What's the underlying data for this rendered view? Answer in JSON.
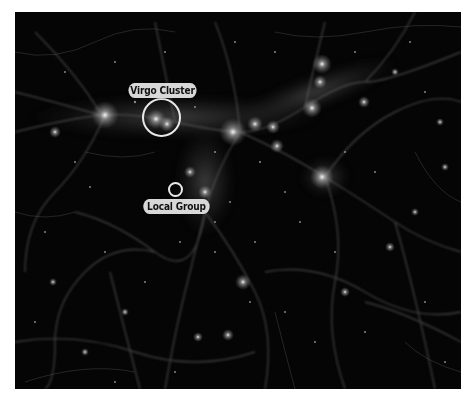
{
  "image": {
    "description": "Cosmic web simulation showing filaments and galaxy clusters in grayscale",
    "background_color": "#050505",
    "filament_color": "#9a9a9a",
    "node_color": "#ffffff"
  },
  "annotations": [
    {
      "label": "Virgo Cluster",
      "marker": "circle",
      "marker_color": "#e8e8e8",
      "label_bg": "#d8d8d8",
      "label_text_color": "#111111"
    },
    {
      "label": "Local Group",
      "marker": "circle",
      "marker_color": "#e8e8e8",
      "label_bg": "#d8d8d8",
      "label_text_color": "#111111"
    }
  ]
}
